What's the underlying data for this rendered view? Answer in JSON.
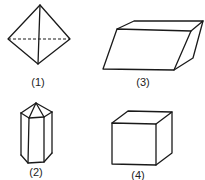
{
  "figures": [
    {
      "id": "1",
      "label": "(1)",
      "shape": "octahedron"
    },
    {
      "id": "2",
      "label": "(2)",
      "shape": "hexagonal-prism-with-pyramid-cap"
    },
    {
      "id": "3",
      "label": "(3)",
      "shape": "parallelepiped"
    },
    {
      "id": "4",
      "label": "(4)",
      "shape": "cube"
    }
  ],
  "colors": {
    "line": "#1a1a1a",
    "background": "#ffffff",
    "text": "#222222"
  }
}
